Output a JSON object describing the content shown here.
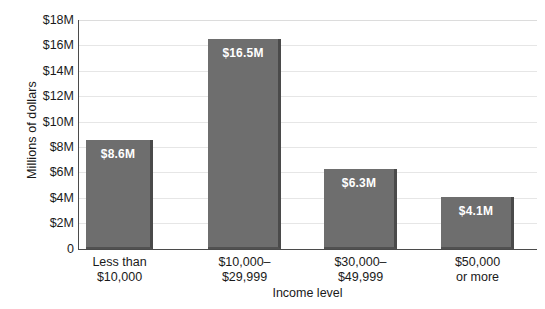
{
  "chart_data": {
    "type": "bar",
    "title": "",
    "xlabel": "Income level",
    "ylabel": "Millions of dollars",
    "categories": [
      "Less than $10,000",
      "$10,000–$29,999",
      "$30,000–$49,999",
      "$50,000 or more"
    ],
    "category_lines": [
      [
        "Less than",
        "$10,000"
      ],
      [
        "$10,000–",
        "$29,999"
      ],
      [
        "$30,000–",
        "$49,999"
      ],
      [
        "$50,000",
        "or more"
      ]
    ],
    "values": [
      8.6,
      16.5,
      6.3,
      4.1
    ],
    "value_labels": [
      "$8.6M",
      "$16.5M",
      "$6.3M",
      "$4.1M"
    ],
    "ylim": [
      0,
      18
    ],
    "y_ticks": [
      0,
      2,
      4,
      6,
      8,
      10,
      12,
      14,
      16,
      18
    ],
    "y_tick_labels": [
      "0",
      "$2M",
      "$4M",
      "$6M",
      "$8M",
      "$10M",
      "$12M",
      "$14M",
      "$16M",
      "$18M"
    ],
    "grid": true,
    "grid_axis": "y",
    "legend": null,
    "colors": {
      "bar_fill": "#6e6e6e",
      "bar_edge": "#4a4a4a",
      "bar_label_text": "#ffffff",
      "gridline": "#e6e6e6",
      "axis_line": "#4b4b4b",
      "text": "#1a1a1a",
      "background": "#ffffff"
    }
  }
}
